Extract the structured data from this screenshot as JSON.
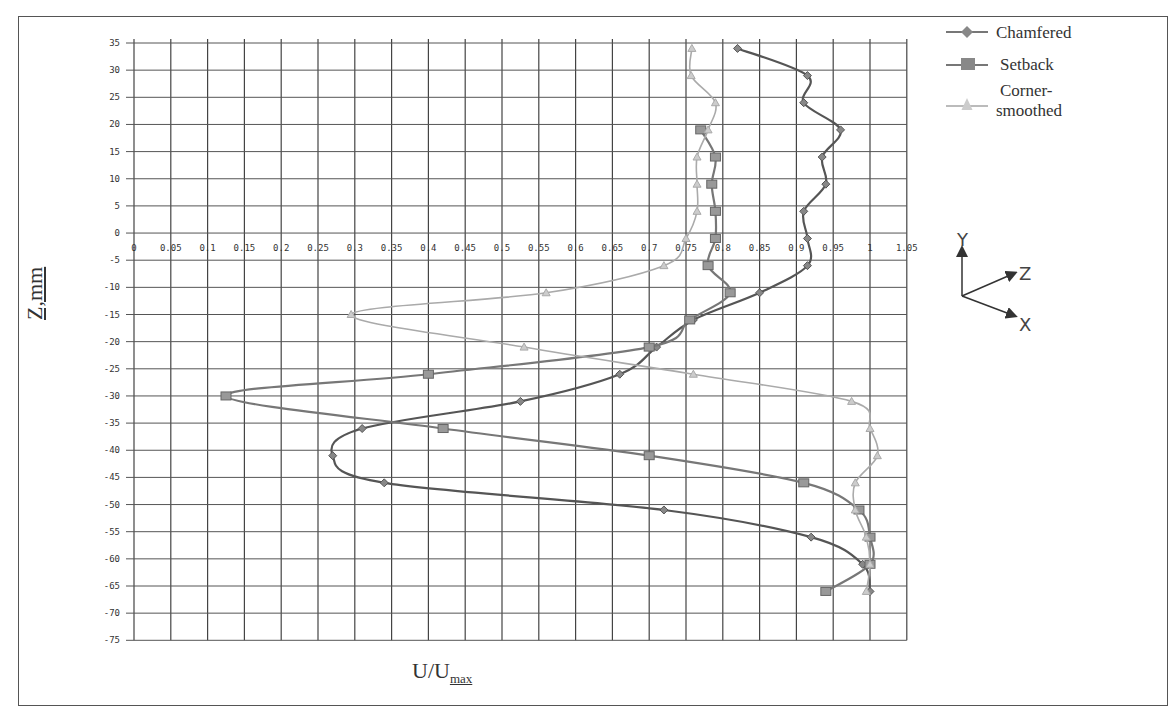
{
  "chart_data": {
    "type": "line",
    "title": "",
    "xlabel": "U/Umax",
    "xlabel_main": "U/U",
    "xlabel_sub": "max",
    "ylabel": "Z,mm",
    "xlim": [
      0,
      1.05
    ],
    "ylim": [
      -75,
      35
    ],
    "x_ticks": [
      "0",
      "0.05",
      "0.1",
      "0.15",
      "0.2",
      "0.25",
      "0.3",
      "0.35",
      "0.4",
      "0.45",
      "0.5",
      "0.55",
      "0.6",
      "0.65",
      "0.7",
      "0.75",
      "0.8",
      "0.85",
      "0.9",
      "0.95",
      "1",
      "1.05"
    ],
    "y_ticks": [
      "35",
      "30",
      "25",
      "20",
      "15",
      "10",
      "5",
      "0",
      "-5",
      "-10",
      "-15",
      "-20",
      "-25",
      "-30",
      "-35",
      "-40",
      "-45",
      "-50",
      "-55",
      "-60",
      "-65",
      "-70",
      "-75"
    ],
    "x_tick_row_z": -2.5,
    "grid": true,
    "legend_position": "upper right, outside plot",
    "series": [
      {
        "name": "Chamfered",
        "marker": "diamond",
        "color": "#555555",
        "points": [
          {
            "u": 0.82,
            "z": 34
          },
          {
            "u": 0.915,
            "z": 29
          },
          {
            "u": 0.91,
            "z": 24
          },
          {
            "u": 0.96,
            "z": 19
          },
          {
            "u": 0.935,
            "z": 14
          },
          {
            "u": 0.94,
            "z": 9
          },
          {
            "u": 0.91,
            "z": 4
          },
          {
            "u": 0.915,
            "z": -1
          },
          {
            "u": 0.915,
            "z": -6
          },
          {
            "u": 0.85,
            "z": -11
          },
          {
            "u": 0.76,
            "z": -16
          },
          {
            "u": 0.71,
            "z": -21
          },
          {
            "u": 0.66,
            "z": -26
          },
          {
            "u": 0.525,
            "z": -31
          },
          {
            "u": 0.31,
            "z": -36
          },
          {
            "u": 0.27,
            "z": -41
          },
          {
            "u": 0.34,
            "z": -46
          },
          {
            "u": 0.72,
            "z": -51
          },
          {
            "u": 0.92,
            "z": -56
          },
          {
            "u": 0.99,
            "z": -61
          },
          {
            "u": 1.0,
            "z": -66
          }
        ]
      },
      {
        "name": "Setback",
        "marker": "square",
        "color": "#777777",
        "points": [
          {
            "u": 0.77,
            "z": 19
          },
          {
            "u": 0.79,
            "z": 14
          },
          {
            "u": 0.785,
            "z": 9
          },
          {
            "u": 0.79,
            "z": 4
          },
          {
            "u": 0.79,
            "z": -1
          },
          {
            "u": 0.78,
            "z": -6
          },
          {
            "u": 0.81,
            "z": -11
          },
          {
            "u": 0.755,
            "z": -16
          },
          {
            "u": 0.7,
            "z": -21
          },
          {
            "u": 0.4,
            "z": -26
          },
          {
            "u": 0.125,
            "z": -30
          },
          {
            "u": 0.42,
            "z": -36
          },
          {
            "u": 0.7,
            "z": -41
          },
          {
            "u": 0.91,
            "z": -46
          },
          {
            "u": 0.985,
            "z": -51
          },
          {
            "u": 1.0,
            "z": -56
          },
          {
            "u": 1.0,
            "z": -61
          },
          {
            "u": 0.94,
            "z": -66
          }
        ]
      },
      {
        "name": "Corner-smoothed",
        "marker": "triangle",
        "color": "#aaaaaa",
        "points": [
          {
            "u": 0.758,
            "z": 34
          },
          {
            "u": 0.757,
            "z": 29
          },
          {
            "u": 0.79,
            "z": 24
          },
          {
            "u": 0.78,
            "z": 19
          },
          {
            "u": 0.765,
            "z": 14
          },
          {
            "u": 0.765,
            "z": 9
          },
          {
            "u": 0.765,
            "z": 4
          },
          {
            "u": 0.75,
            "z": -1
          },
          {
            "u": 0.72,
            "z": -6
          },
          {
            "u": 0.56,
            "z": -11
          },
          {
            "u": 0.295,
            "z": -15
          },
          {
            "u": 0.53,
            "z": -21
          },
          {
            "u": 0.76,
            "z": -26
          },
          {
            "u": 0.975,
            "z": -31
          },
          {
            "u": 1.0,
            "z": -36
          },
          {
            "u": 1.01,
            "z": -41
          },
          {
            "u": 0.98,
            "z": -46
          },
          {
            "u": 0.98,
            "z": -51
          },
          {
            "u": 0.995,
            "z": -56
          },
          {
            "u": 1.0,
            "z": -61
          },
          {
            "u": 0.995,
            "z": -66
          }
        ]
      }
    ]
  },
  "legend": {
    "items": [
      {
        "label": "Chamfered",
        "marker": "diamond",
        "color": "#555555"
      },
      {
        "label": "Setback",
        "marker": "square",
        "color": "#777777"
      },
      {
        "label": "Corner-",
        "label2": "smoothed",
        "marker": "triangle",
        "color": "#aaaaaa"
      }
    ]
  },
  "axes_icon": {
    "y": "Y",
    "z": "Z",
    "x": "X"
  }
}
